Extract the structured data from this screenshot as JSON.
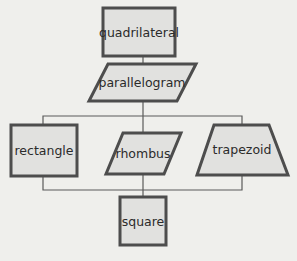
{
  "diagram": {
    "type": "hierarchy",
    "nodes": [
      {
        "id": "quadrilateral",
        "label": "quadrilateral",
        "shape": "rectangle"
      },
      {
        "id": "parallelogram",
        "label": "parallelogram",
        "shape": "parallelogram"
      },
      {
        "id": "rectangle",
        "label": "rectangle",
        "shape": "rectangle"
      },
      {
        "id": "rhombus",
        "label": "rhombus",
        "shape": "parallelogram"
      },
      {
        "id": "trapezoid",
        "label": "trapezoid",
        "shape": "trapezoid"
      },
      {
        "id": "square",
        "label": "square",
        "shape": "square"
      }
    ],
    "edges": [
      {
        "from": "quadrilateral",
        "to": "parallelogram"
      },
      {
        "from": "parallelogram",
        "to": "rectangle"
      },
      {
        "from": "parallelogram",
        "to": "rhombus"
      },
      {
        "from": "parallelogram",
        "to": "trapezoid"
      },
      {
        "from": "rectangle",
        "to": "square"
      },
      {
        "from": "rhombus",
        "to": "square"
      },
      {
        "from": "trapezoid",
        "to": "square"
      }
    ],
    "colors": {
      "background": "#efefec",
      "fill": "#e1e1df",
      "stroke": "#4d4d4d",
      "text": "#2b2b2b"
    }
  }
}
